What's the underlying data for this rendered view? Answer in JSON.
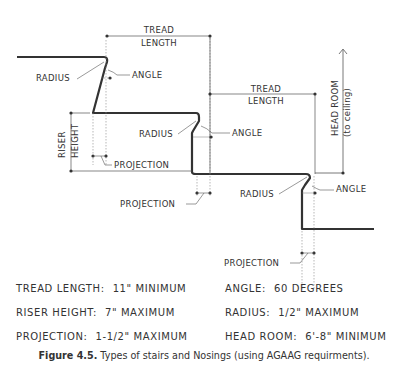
{
  "diagram": {
    "labels": {
      "tread_length_1": [
        "TREAD",
        "LENGTH"
      ],
      "tread_length_2": [
        "TREAD",
        "LENGTH"
      ],
      "radius_1": "RADIUS",
      "radius_2": "RADIUS",
      "radius_3": "RADIUS",
      "angle_1": "ANGLE",
      "angle_2": "ANGLE",
      "angle_3": "ANGLE",
      "riser_height": [
        "RISER",
        "HEIGHT"
      ],
      "projection_1": "PROJECTION",
      "projection_2": "PROJECTION",
      "projection_3": "PROJECTION",
      "head_room": [
        "HEAD ROOM",
        "(to ceiling)"
      ]
    },
    "requirements": [
      {
        "label": "TREAD LENGTH:",
        "value": "11\" MINIMUM"
      },
      {
        "label": "ANGLE:",
        "value": "60 DEGREES"
      },
      {
        "label": "RISER HEIGHT:",
        "value": "7\" MAXIMUM"
      },
      {
        "label": "RADIUS:",
        "value": "1/2\" MAXIMUM"
      },
      {
        "label": "PROJECTION:",
        "value": "1-1/2\" MAXIMUM"
      },
      {
        "label": "HEAD ROOM:",
        "value": "6'-8\" MINIMUM"
      }
    ]
  },
  "caption": {
    "figure": "Figure 4.5.",
    "text": " Types of stairs and Nosings (using AGAAG requirments)."
  }
}
